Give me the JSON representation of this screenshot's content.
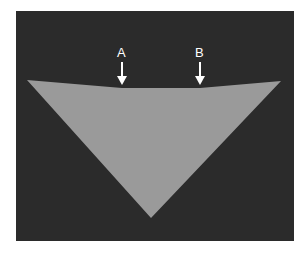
{
  "figure": {
    "background_color": "#2b2b2b",
    "shape_color": "#9a9a9a",
    "shape": "inverted triangle with slightly notched top edge",
    "markers": [
      {
        "label": "A",
        "x": 122,
        "arrow": "down-arrow"
      },
      {
        "label": "B",
        "x": 200,
        "arrow": "down-arrow"
      }
    ]
  }
}
